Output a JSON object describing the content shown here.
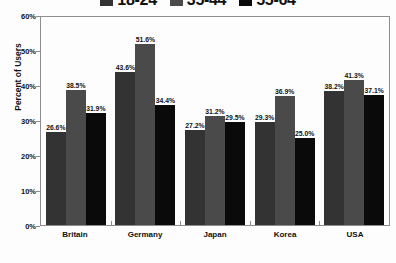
{
  "chart_data": {
    "type": "bar",
    "title": "",
    "subtitle": "",
    "xlabel": "",
    "ylabel": "Percent of Users",
    "ylim": [
      0,
      60
    ],
    "yticks": [
      0,
      10,
      20,
      30,
      40,
      50,
      60
    ],
    "ytick_labels": [
      "0%",
      "10%",
      "20%",
      "30%",
      "40%",
      "50%",
      "60%"
    ],
    "grid": false,
    "legend_position": "top",
    "categories": [
      "Britain",
      "Germany",
      "Japan",
      "Korea",
      "USA"
    ],
    "series": [
      {
        "name": "18-24",
        "color": "#333333",
        "values": [
          26.6,
          43.6,
          27.2,
          29.3,
          38.2
        ],
        "labels": [
          "26.6%",
          "43.6%",
          "27.2%",
          "29.3%",
          "38.2%"
        ]
      },
      {
        "name": "35-44",
        "color": "#4a4a4a",
        "values": [
          38.5,
          51.6,
          31.2,
          36.9,
          41.3
        ],
        "labels": [
          "38.5%",
          "51.6%",
          "31.2%",
          "36.9%",
          "41.3%"
        ]
      },
      {
        "name": "55-64",
        "color": "#0a0a0a",
        "values": [
          31.9,
          34.4,
          29.5,
          25.0,
          37.1
        ],
        "labels": [
          "31.9%",
          "34.4%",
          "29.5%",
          "25.0%",
          "37.1%"
        ]
      }
    ]
  },
  "axis": {
    "frame_color": "#8d8d8d",
    "background": "#fdfdfd"
  }
}
